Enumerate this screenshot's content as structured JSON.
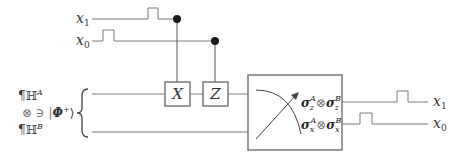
{
  "inputs": {
    "x1_label": "x",
    "x1_sub": "1",
    "x0_label": "x",
    "x0_sub": "0"
  },
  "state": {
    "hilbert_a": "¶ℍ",
    "hilbert_a_sup": "A",
    "tensor_line": "⊗ ∋ |",
    "phi": "Φ",
    "phi_sup": "+",
    "ket_close": "⟩",
    "hilbert_b": "¶ℍ",
    "hilbert_b_sup": "B"
  },
  "gates": {
    "x_gate": "X",
    "z_gate": "Z"
  },
  "measurement": {
    "row1_left": "σ",
    "row1_left_sub": "z",
    "row1_left_sup": "A",
    "row1_op": "⊗",
    "row1_right": "σ",
    "row1_right_sub": "z",
    "row1_right_sup": "B",
    "row2_left": "σ",
    "row2_left_sub": "x",
    "row2_left_sup": "A",
    "row2_op": "⊗",
    "row2_right": "σ",
    "row2_right_sub": "x",
    "row2_right_sup": "B"
  },
  "outputs": {
    "x1_label": "x",
    "x1_sub": "1",
    "x0_label": "x",
    "x0_sub": "0"
  }
}
